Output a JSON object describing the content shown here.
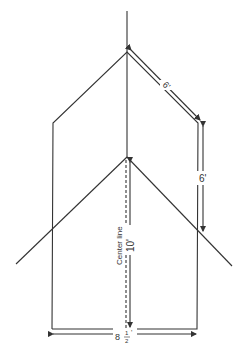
{
  "diagram": {
    "labels": {
      "top_slope": "6'",
      "right_side": "6'",
      "center_height": "10'",
      "center_line": "Center line",
      "base_whole": "8",
      "base_frac_num": "1",
      "base_frac_den": "2",
      "base_prime": "'"
    },
    "colors": {
      "line": "#333333",
      "background": "#ffffff"
    }
  }
}
